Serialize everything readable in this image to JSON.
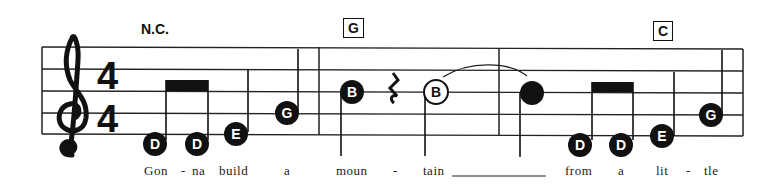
{
  "score": {
    "clef": "treble",
    "time_signature": {
      "top": "4",
      "bottom": "4"
    },
    "chords": [
      {
        "label": "N.C.",
        "boxed": false
      },
      {
        "label": "G",
        "boxed": true
      },
      {
        "label": "C",
        "boxed": true
      }
    ],
    "notes": [
      {
        "name": "D",
        "style": "filled"
      },
      {
        "name": "D",
        "style": "filled"
      },
      {
        "name": "E",
        "style": "filled"
      },
      {
        "name": "G",
        "style": "filled"
      },
      {
        "name": "B",
        "style": "filled"
      },
      {
        "name": "rest",
        "style": "quarter-rest"
      },
      {
        "name": "B",
        "style": "hollow"
      },
      {
        "name": "",
        "style": "filled"
      },
      {
        "name": "D",
        "style": "filled"
      },
      {
        "name": "D",
        "style": "filled"
      },
      {
        "name": "E",
        "style": "filled"
      },
      {
        "name": "G",
        "style": "filled"
      }
    ],
    "lyrics": [
      "Gon",
      "-",
      "na",
      "build",
      "a",
      "moun",
      "-",
      "tain",
      "from",
      "a",
      "lit",
      "-",
      "tle"
    ]
  }
}
